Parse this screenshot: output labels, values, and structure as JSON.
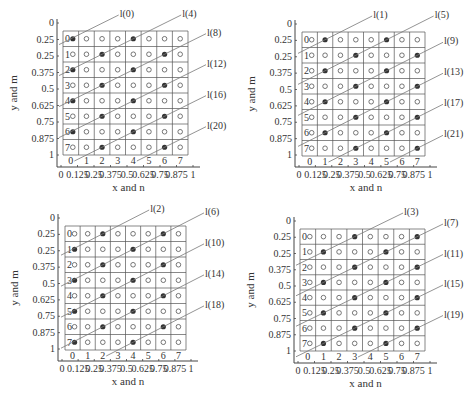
{
  "chart_data": [
    {
      "type": "scatter",
      "title": "",
      "xlabel": "x and n",
      "ylabel": "y and m",
      "x_ticks": [
        "0",
        "0.125",
        "0.25",
        "0.375",
        "0.5",
        "0.625",
        "0.75",
        "0.875",
        "1"
      ],
      "y_ticks": [
        "0",
        "0.25",
        "0.25",
        "0.375",
        "0.5",
        "0.625",
        "0.75",
        "0.875",
        "1"
      ],
      "col_labels": [
        "0",
        "1",
        "2",
        "3",
        "4",
        "5",
        "6",
        "7"
      ],
      "row_labels": [
        "0",
        "1",
        "2",
        "3",
        "4",
        "5",
        "6",
        "7"
      ],
      "grid": {
        "rows": 8,
        "cols": 8
      },
      "filled_points": [
        [
          0,
          0
        ],
        [
          4,
          0
        ],
        [
          2,
          1
        ],
        [
          6,
          1
        ],
        [
          0,
          2
        ],
        [
          4,
          2
        ],
        [
          2,
          3
        ],
        [
          6,
          3
        ],
        [
          0,
          4
        ],
        [
          4,
          4
        ],
        [
          2,
          5
        ],
        [
          6,
          5
        ],
        [
          0,
          6
        ],
        [
          4,
          6
        ],
        [
          2,
          7
        ],
        [
          6,
          7
        ]
      ],
      "lines": [
        "l(0)",
        "l(4)",
        "l(8)",
        "l(12)",
        "l(16)",
        "l(20)"
      ],
      "layout": {
        "left": 63,
        "top": 31,
        "right": 188,
        "bottom": 155,
        "axis_x": 57,
        "axis_y": 167
      }
    },
    {
      "type": "scatter",
      "title": "",
      "xlabel": "x and n",
      "ylabel": "y and m",
      "x_ticks": [
        "0",
        "0.125",
        "0.25",
        "0.375",
        "0.5",
        "0.625",
        "0.75",
        "0.875",
        "1"
      ],
      "y_ticks": [
        "0",
        "0.25",
        "0.25",
        "0.375",
        "0.5",
        "0.625",
        "0.75",
        "0.875",
        "1"
      ],
      "col_labels": [
        "0",
        "1",
        "2",
        "3",
        "4",
        "5",
        "6",
        "7"
      ],
      "row_labels": [
        "0",
        "1",
        "2",
        "3",
        "4",
        "5",
        "6",
        "7"
      ],
      "grid": {
        "rows": 8,
        "cols": 8
      },
      "filled_points": [
        [
          1,
          0
        ],
        [
          5,
          0
        ],
        [
          3,
          1
        ],
        [
          7,
          1
        ],
        [
          1,
          2
        ],
        [
          5,
          2
        ],
        [
          3,
          3
        ],
        [
          7,
          3
        ],
        [
          1,
          4
        ],
        [
          5,
          4
        ],
        [
          3,
          5
        ],
        [
          7,
          5
        ],
        [
          1,
          6
        ],
        [
          5,
          6
        ],
        [
          3,
          7
        ],
        [
          7,
          7
        ]
      ],
      "lines": [
        "l(1)",
        "l(5)",
        "l(9)",
        "l(13)",
        "l(17)",
        "l(21)"
      ],
      "layout": {
        "left": 302,
        "top": 32,
        "right": 425,
        "bottom": 156,
        "axis_x": 295,
        "axis_y": 167
      }
    },
    {
      "type": "scatter",
      "title": "",
      "xlabel": "x and n",
      "ylabel": "y and m",
      "x_ticks": [
        "0",
        "0.125",
        "0.25",
        "0.375",
        "0.5",
        "0.625",
        "0.75",
        "0.875",
        "1"
      ],
      "y_ticks": [
        "0",
        "0.25",
        "0.25",
        "0.375",
        "0.5",
        "0.625",
        "0.75",
        "0.875",
        "1"
      ],
      "col_labels": [
        "0",
        "1",
        "2",
        "3",
        "4",
        "5",
        "6",
        "7"
      ],
      "row_labels": [
        "0",
        "1",
        "2",
        "3",
        "4",
        "5",
        "6",
        "7"
      ],
      "grid": {
        "rows": 8,
        "cols": 8
      },
      "filled_points": [
        [
          2,
          0
        ],
        [
          6,
          0
        ],
        [
          0,
          1
        ],
        [
          4,
          1
        ],
        [
          2,
          2
        ],
        [
          6,
          2
        ],
        [
          0,
          3
        ],
        [
          4,
          3
        ],
        [
          2,
          4
        ],
        [
          6,
          4
        ],
        [
          0,
          5
        ],
        [
          4,
          5
        ],
        [
          2,
          6
        ],
        [
          6,
          6
        ],
        [
          0,
          7
        ],
        [
          4,
          7
        ]
      ],
      "lines": [
        "l(2)",
        "l(6)",
        "l(10)",
        "l(14)",
        "l(18)"
      ],
      "layout": {
        "left": 65,
        "top": 226,
        "right": 186,
        "bottom": 350,
        "axis_x": 58,
        "axis_y": 361
      }
    },
    {
      "type": "scatter",
      "title": "",
      "xlabel": "x and n",
      "ylabel": "y and m",
      "x_ticks": [
        "0",
        "0.125",
        "0.25",
        "0.375",
        "0.5",
        "0.625",
        "0.75",
        "0.875",
        "1"
      ],
      "y_ticks": [
        "0",
        "0.25",
        "0.25",
        "0.375",
        "0.5",
        "0.625",
        "0.75",
        "0.875",
        "1"
      ],
      "col_labels": [
        "0",
        "1",
        "2",
        "3",
        "4",
        "5",
        "6",
        "7"
      ],
      "row_labels": [
        "0",
        "1",
        "2",
        "3",
        "4",
        "5",
        "6",
        "7"
      ],
      "grid": {
        "rows": 8,
        "cols": 8
      },
      "filled_points": [
        [
          3,
          0
        ],
        [
          7,
          0
        ],
        [
          1,
          1
        ],
        [
          5,
          1
        ],
        [
          3,
          2
        ],
        [
          7,
          2
        ],
        [
          1,
          3
        ],
        [
          5,
          3
        ],
        [
          3,
          4
        ],
        [
          7,
          4
        ],
        [
          1,
          5
        ],
        [
          5,
          5
        ],
        [
          3,
          6
        ],
        [
          7,
          6
        ],
        [
          1,
          7
        ],
        [
          5,
          7
        ]
      ],
      "lines": [
        "l(3)",
        "l(7)",
        "l(11)",
        "l(15)",
        "l(19)"
      ],
      "layout": {
        "left": 300,
        "top": 229,
        "right": 425,
        "bottom": 351,
        "axis_x": 294,
        "axis_y": 363
      }
    }
  ],
  "colors": {
    "grid": "#555555",
    "line": "#777777",
    "filled": "#333333",
    "text": "#333333"
  }
}
